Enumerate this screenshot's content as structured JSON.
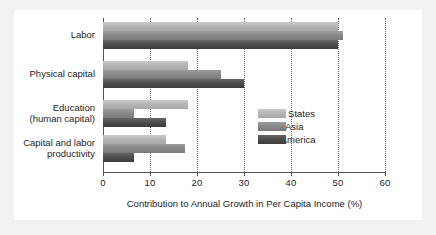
{
  "chart_data": {
    "type": "bar",
    "orientation": "horizontal",
    "title": "",
    "xlabel": "Contribution to Annual Growth in Per Capita Income (%)",
    "ylabel": "",
    "xlim": [
      0,
      60
    ],
    "xticks": [
      0,
      10,
      20,
      30,
      40,
      50,
      60
    ],
    "xticklabels": [
      "0",
      "10",
      "20",
      "30",
      "40",
      "50",
      "60"
    ],
    "grid": "vertical-dotted",
    "legend_position": "center-right",
    "categories": [
      "Labor",
      "Physical capital",
      "Education\n(human capital)",
      "Capital and labor\nproductivity"
    ],
    "series": [
      {
        "name": "United States",
        "color": "#b6b6b6",
        "values": [
          50,
          18,
          18,
          13.5
        ]
      },
      {
        "name": "South Asia",
        "color": "#8a8a8a",
        "values": [
          51,
          25,
          6.5,
          17.5
        ]
      },
      {
        "name": "Latin America",
        "color": "#4e4e4e",
        "values": [
          50,
          30,
          13.5,
          6.5
        ]
      }
    ]
  },
  "legend": {
    "items": [
      {
        "label": "United States",
        "swatch_class": "us"
      },
      {
        "label": "South Asia",
        "swatch_class": "sa"
      },
      {
        "label": "Latin America",
        "swatch_class": "la"
      }
    ]
  },
  "colors": {
    "page_background": "#f2f2f0",
    "plate_background": "#ffffff",
    "axis": "#55555a",
    "grid": "#6b6b70",
    "text": "#1d1d1f"
  }
}
